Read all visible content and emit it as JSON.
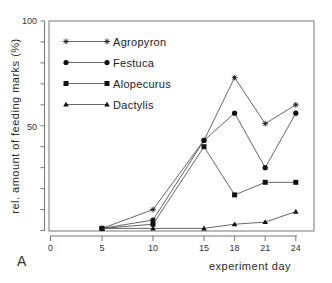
{
  "chart_data": {
    "type": "line",
    "title": "",
    "panel_label": "A",
    "xlabel": "experiment day",
    "ylabel": "rel. amount of feeding marks (%)",
    "x": [
      5,
      10,
      15,
      18,
      21,
      24
    ],
    "x_ticks": [
      0,
      5,
      10,
      15,
      18,
      21,
      24
    ],
    "y_ticks_labeled": [
      100,
      50
    ],
    "y_ticks_minor_step": 10,
    "xlim": [
      0,
      25
    ],
    "ylim": [
      0,
      100
    ],
    "grid": false,
    "legend_position": "upper-left",
    "series": [
      {
        "name": "Agropyron",
        "marker": "star",
        "values": [
          1,
          10,
          43,
          73,
          51,
          60
        ]
      },
      {
        "name": "Festuca",
        "marker": "circle",
        "values": [
          1,
          5,
          43,
          56,
          30,
          56
        ]
      },
      {
        "name": "Alopecurus",
        "marker": "square",
        "values": [
          1,
          3,
          40,
          17,
          23,
          23
        ]
      },
      {
        "name": "Dactylis",
        "marker": "triangle",
        "values": [
          1,
          1,
          1,
          3,
          4,
          9
        ]
      }
    ]
  }
}
